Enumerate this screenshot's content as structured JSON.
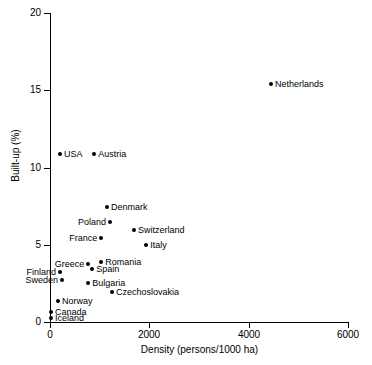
{
  "chart_data": {
    "type": "scatter",
    "title": "",
    "xlabel": "Density (persons/1000 ha)",
    "ylabel": "Built-up (%)",
    "xlim": [
      0,
      6000
    ],
    "ylim": [
      0,
      20
    ],
    "xticks": [
      0,
      2000,
      4000,
      6000
    ],
    "xtick_labels": [
      "0",
      "2000",
      "4000",
      "6000"
    ],
    "yticks": [
      0,
      5,
      10,
      15,
      20
    ],
    "ytick_labels": [
      "0",
      "5",
      "10",
      "15",
      "20"
    ],
    "grid": false,
    "legend": "none",
    "marker": "filled-circle",
    "marker_color": "#000000",
    "points": [
      {
        "label": "Netherlands",
        "x": 4450,
        "y": 15.4,
        "label_side": "right"
      },
      {
        "label": "USA",
        "x": 200,
        "y": 10.85,
        "label_side": "right"
      },
      {
        "label": "Austria",
        "x": 890,
        "y": 10.85,
        "label_side": "right"
      },
      {
        "label": "Denmark",
        "x": 1150,
        "y": 7.45,
        "label_side": "right"
      },
      {
        "label": "Poland",
        "x": 1210,
        "y": 6.45,
        "label_side": "left"
      },
      {
        "label": "Switzerland",
        "x": 1690,
        "y": 5.95,
        "label_side": "right"
      },
      {
        "label": "France",
        "x": 1030,
        "y": 5.45,
        "label_side": "left"
      },
      {
        "label": "Italy",
        "x": 1940,
        "y": 5.0,
        "label_side": "right"
      },
      {
        "label": "Romania",
        "x": 1030,
        "y": 3.9,
        "label_side": "right"
      },
      {
        "label": "Greece",
        "x": 770,
        "y": 3.75,
        "label_side": "left"
      },
      {
        "label": "Spain",
        "x": 850,
        "y": 3.45,
        "label_side": "right"
      },
      {
        "label": "Finland",
        "x": 200,
        "y": 3.25,
        "label_side": "left"
      },
      {
        "label": "Sweden",
        "x": 240,
        "y": 2.75,
        "label_side": "left"
      },
      {
        "label": "Bulgaria",
        "x": 770,
        "y": 2.55,
        "label_side": "right"
      },
      {
        "label": "Czechoslovakia",
        "x": 1250,
        "y": 1.95,
        "label_side": "right"
      },
      {
        "label": "Norway",
        "x": 160,
        "y": 1.35,
        "label_side": "right"
      },
      {
        "label": "Canada",
        "x": 20,
        "y": 0.65,
        "label_side": "right"
      },
      {
        "label": "Iceland",
        "x": 20,
        "y": 0.25,
        "label_side": "right"
      }
    ]
  }
}
